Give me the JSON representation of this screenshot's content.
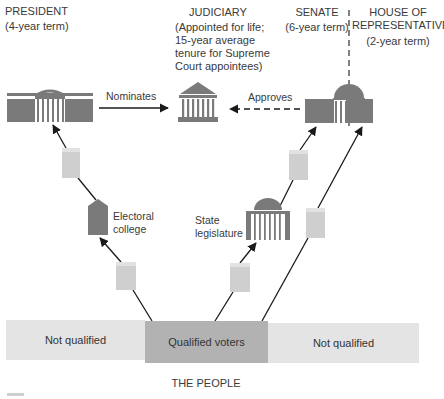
{
  "branches": {
    "president": {
      "title": "PRESIDENT",
      "term": "(4-year term)"
    },
    "judiciary": {
      "title": "JUDICIARY",
      "term_lines": [
        "(Appointed for life;",
        "15-year average",
        "tenure for Supreme",
        "Court appointees)"
      ]
    },
    "senate": {
      "title": "SENATE",
      "term": "(6-year term)"
    },
    "house": {
      "title_lines": [
        "HOUSE OF",
        "REPRESENTATIVES"
      ],
      "term": "(2-year term)"
    }
  },
  "relations": {
    "nominates": "Nominates",
    "approves": "Approves"
  },
  "intermediaries": {
    "electoral_college": [
      "Electoral",
      "college"
    ],
    "state_legislature": [
      "State",
      "legislature"
    ]
  },
  "people_bar": {
    "segments": [
      {
        "label": "Not qualified",
        "color": "#e4e4e4"
      },
      {
        "label": "Qualified voters",
        "color": "#b2b2b2"
      },
      {
        "label": "Not qualified",
        "color": "#e4e4e4"
      }
    ],
    "caption": "THE PEOPLE"
  },
  "colors": {
    "building_dark": "#7a7a7a",
    "ballot_box": "#cfcfcf",
    "ballot_box_top": "#e2e2e2",
    "arrow": "#1a1a1a"
  }
}
